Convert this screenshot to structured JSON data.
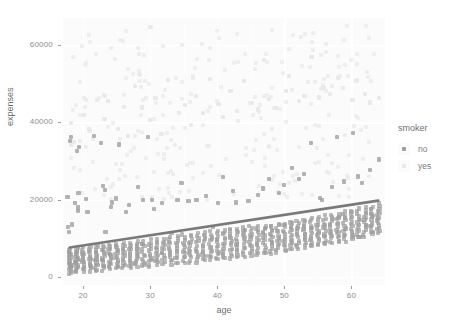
{
  "chart_data": {
    "type": "scatter",
    "title": "",
    "xlabel": "age",
    "ylabel": "expenses",
    "xlim": [
      17,
      65
    ],
    "ylim": [
      -2000,
      67000
    ],
    "xticks": [
      20,
      30,
      40,
      50,
      60
    ],
    "yticks": [
      0,
      20000,
      40000,
      60000
    ],
    "ytick_labels": [
      "0",
      "20000",
      "40000",
      "60000"
    ],
    "xtick_labels": [
      "20",
      "30",
      "40",
      "50",
      "60"
    ],
    "grid": true,
    "legend": {
      "title": "smoker",
      "position": "right",
      "entries": [
        {
          "label": "no",
          "color": "#9e9e9e"
        },
        {
          "label": "yes",
          "color": "#e8e8e8"
        }
      ]
    },
    "trendline": {
      "name": "linear fit",
      "color": "#7a7a7a",
      "x": [
        18,
        64
      ],
      "y": [
        7700,
        19800
      ]
    },
    "series": [
      {
        "name": "no",
        "color": "#9e9e9e",
        "description": "dense low band rising with age plus a sparse upper scatter",
        "bands": [
          {
            "age": 18,
            "y_low": 1100,
            "y_high": 7200,
            "n": 22
          },
          {
            "age": 19,
            "y_low": 1300,
            "y_high": 7400,
            "n": 21
          },
          {
            "age": 20,
            "y_low": 1400,
            "y_high": 7600,
            "n": 15
          },
          {
            "age": 21,
            "y_low": 1600,
            "y_high": 7800,
            "n": 14
          },
          {
            "age": 22,
            "y_low": 1700,
            "y_high": 8000,
            "n": 16
          },
          {
            "age": 23,
            "y_low": 1900,
            "y_high": 8200,
            "n": 15
          },
          {
            "age": 24,
            "y_low": 2000,
            "y_high": 8400,
            "n": 15
          },
          {
            "age": 25,
            "y_low": 2200,
            "y_high": 8600,
            "n": 15
          },
          {
            "age": 26,
            "y_low": 2300,
            "y_high": 8800,
            "n": 14
          },
          {
            "age": 27,
            "y_low": 2500,
            "y_high": 9000,
            "n": 14
          },
          {
            "age": 28,
            "y_low": 2600,
            "y_high": 9200,
            "n": 14
          },
          {
            "age": 29,
            "y_low": 2800,
            "y_high": 9400,
            "n": 13
          },
          {
            "age": 30,
            "y_low": 2900,
            "y_high": 9600,
            "n": 13
          },
          {
            "age": 31,
            "y_low": 3100,
            "y_high": 9800,
            "n": 13
          },
          {
            "age": 32,
            "y_low": 3200,
            "y_high": 10000,
            "n": 13
          },
          {
            "age": 33,
            "y_low": 3400,
            "y_high": 10200,
            "n": 13
          },
          {
            "age": 34,
            "y_low": 3500,
            "y_high": 10500,
            "n": 13
          },
          {
            "age": 35,
            "y_low": 3700,
            "y_high": 10800,
            "n": 13
          },
          {
            "age": 36,
            "y_low": 3900,
            "y_high": 11000,
            "n": 13
          },
          {
            "age": 37,
            "y_low": 4000,
            "y_high": 11200,
            "n": 13
          },
          {
            "age": 38,
            "y_low": 4200,
            "y_high": 11500,
            "n": 13
          },
          {
            "age": 39,
            "y_low": 4400,
            "y_high": 11800,
            "n": 13
          },
          {
            "age": 40,
            "y_low": 4600,
            "y_high": 12000,
            "n": 13
          },
          {
            "age": 41,
            "y_low": 4800,
            "y_high": 12200,
            "n": 13
          },
          {
            "age": 42,
            "y_low": 5000,
            "y_high": 12400,
            "n": 13
          },
          {
            "age": 43,
            "y_low": 5200,
            "y_high": 12600,
            "n": 13
          },
          {
            "age": 44,
            "y_low": 5400,
            "y_high": 12800,
            "n": 13
          },
          {
            "age": 45,
            "y_low": 5600,
            "y_high": 13000,
            "n": 14
          },
          {
            "age": 46,
            "y_low": 5800,
            "y_high": 13200,
            "n": 14
          },
          {
            "age": 47,
            "y_low": 6000,
            "y_high": 13400,
            "n": 14
          },
          {
            "age": 48,
            "y_low": 6300,
            "y_high": 13600,
            "n": 14
          },
          {
            "age": 49,
            "y_low": 6500,
            "y_high": 13800,
            "n": 14
          },
          {
            "age": 50,
            "y_low": 6800,
            "y_high": 14000,
            "n": 14
          },
          {
            "age": 51,
            "y_low": 7000,
            "y_high": 14300,
            "n": 14
          },
          {
            "age": 52,
            "y_low": 7300,
            "y_high": 14600,
            "n": 14
          },
          {
            "age": 53,
            "y_low": 7600,
            "y_high": 14900,
            "n": 14
          },
          {
            "age": 54,
            "y_low": 7900,
            "y_high": 15200,
            "n": 14
          },
          {
            "age": 55,
            "y_low": 8200,
            "y_high": 15500,
            "n": 14
          },
          {
            "age": 56,
            "y_low": 8500,
            "y_high": 15800,
            "n": 14
          },
          {
            "age": 57,
            "y_low": 8800,
            "y_high": 16100,
            "n": 14
          },
          {
            "age": 58,
            "y_low": 9100,
            "y_high": 16400,
            "n": 14
          },
          {
            "age": 59,
            "y_low": 9400,
            "y_high": 16800,
            "n": 14
          },
          {
            "age": 60,
            "y_low": 9800,
            "y_high": 17200,
            "n": 14
          },
          {
            "age": 61,
            "y_low": 10200,
            "y_high": 17600,
            "n": 14
          },
          {
            "age": 62,
            "y_low": 10600,
            "y_high": 18000,
            "n": 15
          },
          {
            "age": 63,
            "y_low": 11000,
            "y_high": 18400,
            "n": 15
          },
          {
            "age": 64,
            "y_low": 11400,
            "y_high": 19000,
            "n": 15
          }
        ],
        "outliers": [
          [
            18,
            21000
          ],
          [
            18,
            14000
          ],
          [
            18,
            13000
          ],
          [
            18,
            12000
          ],
          [
            18,
            36000
          ],
          [
            18,
            35000
          ],
          [
            19,
            17000
          ],
          [
            19,
            18000
          ],
          [
            19,
            19000
          ],
          [
            19,
            34000
          ],
          [
            19,
            33000
          ],
          [
            19,
            22000
          ],
          [
            20,
            20000
          ],
          [
            21,
            17000
          ],
          [
            22,
            36000
          ],
          [
            23,
            24000
          ],
          [
            23,
            23000
          ],
          [
            23,
            12000
          ],
          [
            23,
            35000
          ],
          [
            24,
            18000
          ],
          [
            24,
            19000
          ],
          [
            25,
            20000
          ],
          [
            25,
            34000
          ],
          [
            26,
            17000
          ],
          [
            27,
            19000
          ],
          [
            28,
            23000
          ],
          [
            29,
            20000
          ],
          [
            30,
            20000
          ],
          [
            30,
            36000
          ],
          [
            31,
            18000
          ],
          [
            32,
            19000
          ],
          [
            33,
            11500
          ],
          [
            34,
            20000
          ],
          [
            35,
            24000
          ],
          [
            36,
            20000
          ],
          [
            37,
            19500
          ],
          [
            38,
            21000
          ],
          [
            39,
            13000
          ],
          [
            40,
            19000
          ],
          [
            41,
            26000
          ],
          [
            42,
            22000
          ],
          [
            43,
            19000
          ],
          [
            44,
            12500
          ],
          [
            45,
            20000
          ],
          [
            46,
            21000
          ],
          [
            47,
            23000
          ],
          [
            48,
            25000
          ],
          [
            49,
            22000
          ],
          [
            50,
            24000
          ],
          [
            51,
            28000
          ],
          [
            52,
            25000
          ],
          [
            53,
            27000
          ],
          [
            54,
            35000
          ],
          [
            55,
            21000
          ],
          [
            56,
            20000
          ],
          [
            57,
            23000
          ],
          [
            58,
            36000
          ],
          [
            59,
            25000
          ],
          [
            60,
            37000
          ],
          [
            61,
            26000
          ],
          [
            62,
            24000
          ],
          [
            63,
            28000
          ],
          [
            64,
            30000
          ]
        ]
      },
      {
        "name": "yes",
        "color": "#e8e8e8",
        "description": "very pale points spread across the upper half of the panel",
        "points": [
          [
            18,
            39000
          ],
          [
            18,
            33000
          ],
          [
            19,
            36000
          ],
          [
            20,
            42000
          ],
          [
            21,
            38000
          ],
          [
            22,
            45000
          ],
          [
            23,
            41000
          ],
          [
            24,
            47000
          ],
          [
            25,
            39000
          ],
          [
            26,
            44000
          ],
          [
            27,
            37000
          ],
          [
            28,
            48000
          ],
          [
            29,
            43000
          ],
          [
            30,
            40000
          ],
          [
            31,
            46000
          ],
          [
            32,
            38000
          ],
          [
            33,
            52000
          ],
          [
            34,
            41000
          ],
          [
            35,
            44000
          ],
          [
            36,
            39000
          ],
          [
            37,
            47000
          ],
          [
            38,
            42000
          ],
          [
            39,
            50000
          ],
          [
            40,
            45000
          ],
          [
            41,
            40000
          ],
          [
            42,
            48000
          ],
          [
            43,
            43000
          ],
          [
            44,
            51000
          ],
          [
            45,
            46000
          ],
          [
            46,
            42000
          ],
          [
            47,
            55000
          ],
          [
            48,
            47000
          ],
          [
            49,
            44000
          ],
          [
            50,
            49000
          ],
          [
            51,
            53000
          ],
          [
            52,
            46000
          ],
          [
            53,
            48000
          ],
          [
            54,
            58000
          ],
          [
            55,
            45000
          ],
          [
            56,
            50000
          ],
          [
            57,
            47000
          ],
          [
            58,
            52000
          ],
          [
            59,
            49000
          ],
          [
            60,
            46000
          ],
          [
            61,
            51000
          ],
          [
            62,
            48000
          ],
          [
            63,
            45000
          ],
          [
            64,
            47000
          ]
        ]
      }
    ]
  }
}
